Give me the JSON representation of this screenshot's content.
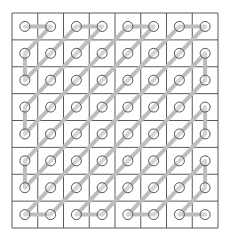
{
  "diagram": {
    "title": "",
    "type": "zigzag-scan",
    "rows": 8,
    "cols": 8,
    "grid": {
      "x0": 12,
      "y0": 13,
      "x1": 218,
      "y1": 228
    },
    "colors": {
      "background": "#ffffff",
      "grid_line": "#5a5a5a",
      "path": "#bdbdbd",
      "node_stroke": "#555555",
      "node_fill": "rgba(255,255,255,0.35)"
    },
    "node_radius": 5,
    "path_width": 4
  }
}
